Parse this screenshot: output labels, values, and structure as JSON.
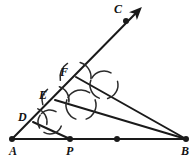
{
  "figure": {
    "stroke_color": "#1a1a1a",
    "background_color": "#ffffff",
    "arc_color": "#2b2b2b"
  },
  "points": [
    {
      "id": "A",
      "label": "A",
      "x": 12,
      "y": 139,
      "dot": true,
      "label_x": 9,
      "label_y": 145
    },
    {
      "id": "P",
      "label": "P",
      "x": 70,
      "y": 139,
      "dot": true,
      "label_x": 66,
      "label_y": 145
    },
    {
      "id": "B",
      "label": "B",
      "x": 186,
      "y": 139,
      "dot": true,
      "label_x": 181,
      "label_y": 145
    },
    {
      "id": "C",
      "label": "C",
      "x": 126,
      "y": 21,
      "dot": true,
      "label_x": 114,
      "label_y": 3
    },
    {
      "id": "D",
      "label": "D",
      "x": 33,
      "y": 122,
      "dot": false,
      "label_x": 18,
      "label_y": 111
    },
    {
      "id": "E",
      "label": "E",
      "x": 55,
      "y": 100,
      "dot": false,
      "label_x": 39,
      "label_y": 89
    },
    {
      "id": "F",
      "label": "F",
      "x": 76,
      "y": 77,
      "dot": false,
      "label_x": 60,
      "label_y": 66
    },
    {
      "id": "Q",
      "label": "",
      "x": 117,
      "y": 139,
      "dot": true,
      "label_x": 0,
      "label_y": 0
    }
  ],
  "segments": [
    {
      "name": "base-AB",
      "x1": 12,
      "y1": 139,
      "x2": 186,
      "y2": 139,
      "width": 2.2,
      "arrow": false
    },
    {
      "name": "ray-AC",
      "x1": 12,
      "y1": 139,
      "x2": 136,
      "y2": 13,
      "width": 2.0,
      "arrow": true
    },
    {
      "name": "chord-F-B",
      "x1": 76,
      "y1": 77,
      "x2": 186,
      "y2": 139,
      "width": 2.0,
      "arrow": false
    },
    {
      "name": "chord-E-Q",
      "x1": 55,
      "y1": 100,
      "x2": 186,
      "y2": 139,
      "width": 2.0,
      "arrow": false
    },
    {
      "name": "chord-D-P",
      "x1": 33,
      "y1": 122,
      "x2": 70,
      "y2": 139,
      "width": 2.0,
      "arrow": false
    }
  ],
  "arcs": [
    {
      "name": "arc-cross-lower-1",
      "cx": 50,
      "cy": 122,
      "r": 12,
      "a1": -135,
      "a2": -60,
      "width": 1.5
    },
    {
      "name": "arc-cross-lower-2",
      "cx": 50,
      "cy": 122,
      "r": 12,
      "a1": 20,
      "a2": 120,
      "width": 1.5
    },
    {
      "name": "arc-cross-lower-3",
      "cx": 50,
      "cy": 122,
      "r": 12,
      "a1": 150,
      "a2": 215,
      "width": 1.5
    },
    {
      "name": "arc-cross-mid-1",
      "cx": 81,
      "cy": 105,
      "r": 15,
      "a1": -150,
      "a2": -55,
      "width": 1.5
    },
    {
      "name": "arc-cross-mid-2",
      "cx": 81,
      "cy": 105,
      "r": 15,
      "a1": -20,
      "a2": 70,
      "width": 1.5
    },
    {
      "name": "arc-cross-mid-3",
      "cx": 81,
      "cy": 105,
      "r": 15,
      "a1": 110,
      "a2": 200,
      "width": 1.5
    },
    {
      "name": "arc-cross-upper-1",
      "cx": 104,
      "cy": 85,
      "r": 14,
      "a1": -150,
      "a2": -60,
      "width": 1.5
    },
    {
      "name": "arc-cross-upper-2",
      "cx": 104,
      "cy": 85,
      "r": 14,
      "a1": -15,
      "a2": 75,
      "width": 1.5
    },
    {
      "name": "arc-cross-upper-3",
      "cx": 104,
      "cy": 85,
      "r": 14,
      "a1": 110,
      "a2": 200,
      "width": 1.5
    },
    {
      "name": "arc-at-D",
      "cx": 33,
      "cy": 122,
      "r": 14,
      "a1": -70,
      "a2": 10,
      "width": 1.5
    },
    {
      "name": "arc-at-E",
      "cx": 55,
      "cy": 100,
      "r": 14,
      "a1": -72,
      "a2": 8,
      "width": 1.5
    },
    {
      "name": "arc-at-F",
      "cx": 76,
      "cy": 77,
      "r": 15,
      "a1": -74,
      "a2": 6,
      "width": 1.5
    },
    {
      "name": "arc-above-E",
      "cx": 55,
      "cy": 100,
      "r": 13,
      "a1": 160,
      "a2": 235,
      "width": 1.5
    },
    {
      "name": "arc-above-F",
      "cx": 76,
      "cy": 77,
      "r": 16,
      "a1": 168,
      "a2": 238,
      "width": 1.5
    }
  ]
}
